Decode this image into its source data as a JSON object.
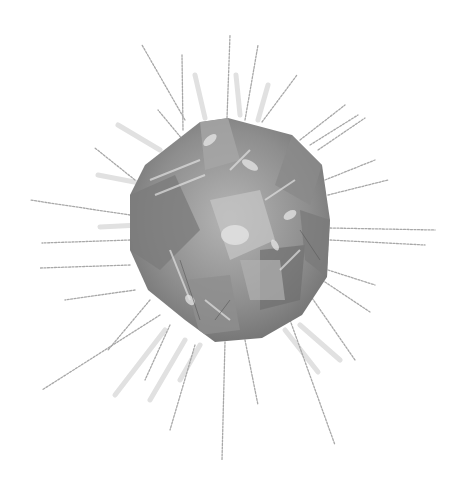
{
  "image": {
    "subject": "crystal-with-radiating-strokes",
    "alt": "Grayscale illustration of a faceted crystal surrounded by radiating pencil strokes",
    "colors": {
      "background": "#ffffff",
      "crystal_dark": "#6e6e6e",
      "crystal_mid": "#9a9a9a",
      "crystal_light": "#cfcfcf",
      "ray_light": "#dcdcdc",
      "ray_dark": "#9c9c9c"
    }
  }
}
